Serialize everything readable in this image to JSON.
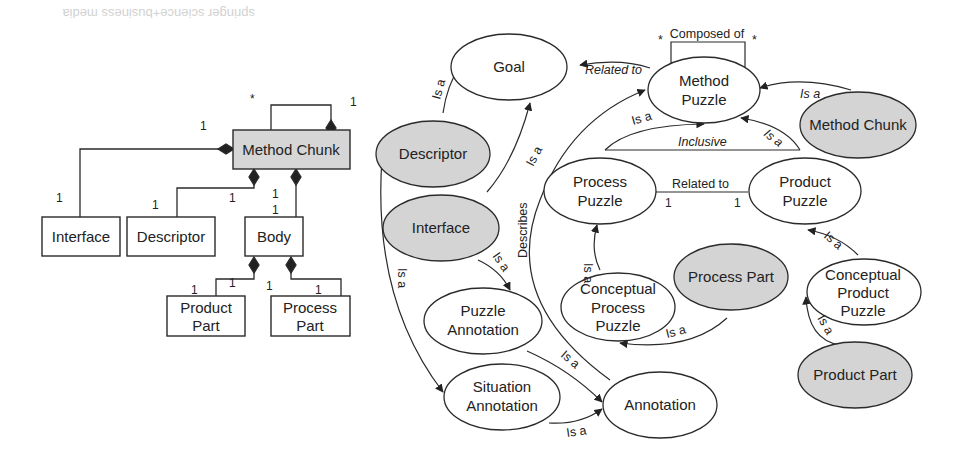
{
  "header": {
    "caption_fragment": "springer science+business media"
  },
  "uml_diagram": {
    "classes": {
      "method_chunk": "Method Chunk",
      "interface": "Interface",
      "descriptor": "Descriptor",
      "body": "Body",
      "product_part_1": "Product",
      "product_part_2": "Part",
      "process_part_1": "Process",
      "process_part_2": "Part"
    },
    "multiplicities": {
      "self_star": "*",
      "self_one": "1",
      "interface_top": "1",
      "interface_bottom": "1",
      "descriptor_left": "1",
      "descriptor_right": "1",
      "body_a": "1",
      "body_b": "1",
      "product_left": "1",
      "product_right": "1",
      "process_left": "1",
      "process_right": "1"
    }
  },
  "ontology_diagram": {
    "nodes": {
      "goal": "Goal",
      "method_puzzle_1": "Method",
      "method_puzzle_2": "Puzzle",
      "method_chunk": "Method Chunk",
      "descriptor": "Descriptor",
      "interface": "Interface",
      "process_puzzle_1": "Process",
      "process_puzzle_2": "Puzzle",
      "product_puzzle_1": "Product",
      "product_puzzle_2": "Puzzle",
      "process_part": "Process Part",
      "conceptual_process_puzzle_1": "Conceptual",
      "conceptual_process_puzzle_2": "Process",
      "conceptual_process_puzzle_3": "Puzzle",
      "conceptual_product_puzzle_1": "Conceptual",
      "conceptual_product_puzzle_2": "Product",
      "conceptual_product_puzzle_3": "Puzzle",
      "product_part": "Product Part",
      "puzzle_annotation_1": "Puzzle",
      "puzzle_annotation_2": "Annotation",
      "situation_annotation_1": "Situation",
      "situation_annotation_2": "Annotation",
      "annotation": "Annotation"
    },
    "edge_labels": {
      "composed_of": "Composed of",
      "composed_star_left": "*",
      "composed_star_right": "*",
      "related_to_goal": "Related to",
      "descriptor_isa_goal": "Is a",
      "interface_isa_goal": "Is a",
      "method_chunk_isa": "Is a",
      "process_puzzle_isa": "Is a",
      "product_puzzle_isa": "Is a",
      "inclusive": "Inclusive",
      "related_to_puzzles": "Related to",
      "related_mult_left": "1",
      "related_mult_right": "1",
      "describes": "Describes",
      "interface_isa_puzzle_annotation": "Is a",
      "descriptor_isa_situation": "Is a",
      "conceptual_process_isa": "Is a",
      "process_part_isa": "Is a",
      "conceptual_product_isa": "Is a",
      "product_part_isa": "Is a",
      "puzzle_annotation_isa": "Is a",
      "situation_annotation_isa": "Is a"
    },
    "colors": {
      "shaded_fill": "#d4d4d4",
      "plain_fill": "#ffffff",
      "stroke": "#2a2a2a"
    }
  }
}
